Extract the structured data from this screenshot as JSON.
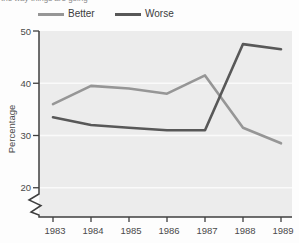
{
  "clipped_caption": "the way things are going",
  "legend": {
    "items": [
      "Better",
      "Worse"
    ]
  },
  "chart_data": {
    "type": "line",
    "categories": [
      "1983",
      "1984",
      "1985",
      "1986",
      "1987",
      "1988",
      "1989"
    ],
    "series": [
      {
        "name": "Better",
        "color": "#969696",
        "values": [
          36,
          39.5,
          39,
          38,
          41.5,
          31.5,
          28.5
        ]
      },
      {
        "name": "Worse",
        "color": "#585858",
        "values": [
          33.5,
          32,
          31.5,
          31,
          31,
          47.5,
          46.5
        ]
      }
    ],
    "title": "",
    "xlabel": "",
    "ylabel": "Percentage",
    "yticks": [
      20,
      30,
      40,
      50
    ],
    "ylim": [
      20,
      50
    ],
    "axis_break_below_min": true,
    "grid": "horizontal",
    "grid_color": "#fafafa",
    "plot_bg": "#ececec",
    "axis_color": "#3f3f3f",
    "tick_label_color": "#4a4a4a",
    "legend_position": "top"
  }
}
